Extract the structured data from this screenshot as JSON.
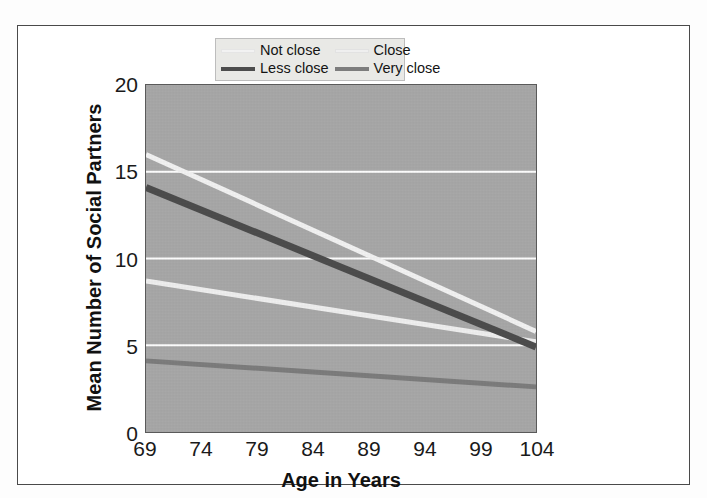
{
  "chart_data": {
    "type": "line",
    "title": "",
    "subtitle": "",
    "xlabel": "Age in Years",
    "ylabel": "Mean Number of Social Partners",
    "x": [
      69,
      104
    ],
    "xlim": [
      69,
      104
    ],
    "ylim": [
      0,
      20
    ],
    "xticks": [
      "69",
      "74",
      "79",
      "84",
      "89",
      "94",
      "99",
      "104"
    ],
    "yticks": [
      "0",
      "5",
      "10",
      "15",
      "20"
    ],
    "grid": "horizontal",
    "legend_position": "top-right-inside",
    "series": [
      {
        "name": "Not close",
        "color": "#f2f2f2",
        "values": [
          16.0,
          5.8
        ]
      },
      {
        "name": "Close",
        "color": "#efefef",
        "values": [
          8.7,
          5.2
        ]
      },
      {
        "name": "Less close",
        "color": "#4d4d4d",
        "values": [
          14.1,
          4.9
        ]
      },
      {
        "name": "Very close",
        "color": "#7d7d7d",
        "values": [
          4.1,
          2.6
        ]
      }
    ],
    "plot_background": "#a8a8a8",
    "gridline_color": "#ffffff",
    "figure_background": "#ffffff"
  },
  "legend": {
    "entries": [
      {
        "label": "Not close"
      },
      {
        "label": "Close"
      },
      {
        "label": "Less close"
      },
      {
        "label": "Very close"
      }
    ]
  }
}
